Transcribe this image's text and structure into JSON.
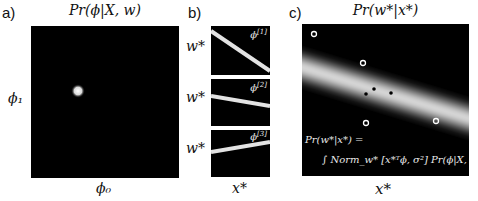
{
  "panel_a": {
    "label": "a)",
    "title": "Pr(ϕ|X, w)",
    "xlabel": "ϕ₀",
    "ylabel": "ϕ₁",
    "blob": {
      "cx_frac": 0.32,
      "cy_frac": 0.43
    }
  },
  "panel_b": {
    "label": "b)",
    "ylabel": "w*",
    "xlabel": "x*",
    "subplots": [
      {
        "tag": "ϕ^[1]",
        "tag_base": "ϕ",
        "tag_sup": "[1]",
        "ylabel": "w*",
        "line": {
          "y0_frac": 0.22,
          "y1_frac": 0.92
        }
      },
      {
        "tag": "ϕ^[2]",
        "tag_base": "ϕ",
        "tag_sup": "[2]",
        "ylabel": "w*",
        "line": {
          "y0_frac": 0.42,
          "y1_frac": 0.62
        }
      },
      {
        "tag": "ϕ^[3]",
        "tag_base": "ϕ",
        "tag_sup": "[3]",
        "ylabel": "w*",
        "line": {
          "y0_frac": 0.52,
          "y1_frac": 0.28
        }
      }
    ]
  },
  "panel_c": {
    "label": "c)",
    "title": "Pr(w*|x*)",
    "xlabel": "x*",
    "formula_line1": "Pr(w*|x*) =",
    "formula_line2": "∫ Norm_w* [x*ᵀϕ, σ²] Pr(ϕ|X, w) dϕ",
    "open_points": [
      [
        0.07,
        0.06
      ],
      [
        0.37,
        0.26
      ],
      [
        0.8,
        0.62
      ],
      [
        0.39,
        0.65
      ]
    ],
    "filled_points": [
      [
        0.38,
        0.46
      ],
      [
        0.43,
        0.43
      ],
      [
        0.52,
        0.45
      ]
    ]
  }
}
